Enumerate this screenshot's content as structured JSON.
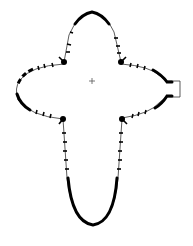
{
  "diagram": {
    "type": "outline-shape",
    "colors": {
      "stroke": "#000000",
      "thin_stroke": "#333333",
      "background": "#ffffff"
    },
    "center_marker": {
      "shape": "crosshair",
      "x": 92,
      "y": 81
    },
    "lobes": [
      {
        "name": "top",
        "apex": [
          92,
          12
        ]
      },
      {
        "name": "left",
        "apex": [
          16,
          88
        ]
      },
      {
        "name": "right",
        "apex": [
          166,
          88
        ],
        "feature": "rectangular port"
      },
      {
        "name": "bottom",
        "apex": [
          93,
          225
        ]
      }
    ],
    "corners": [
      {
        "name": "top-left",
        "x": 64,
        "y": 62
      },
      {
        "name": "top-right",
        "x": 121,
        "y": 62
      },
      {
        "name": "bottom-left",
        "x": 63,
        "y": 118
      },
      {
        "name": "bottom-right",
        "x": 122,
        "y": 118
      }
    ]
  }
}
